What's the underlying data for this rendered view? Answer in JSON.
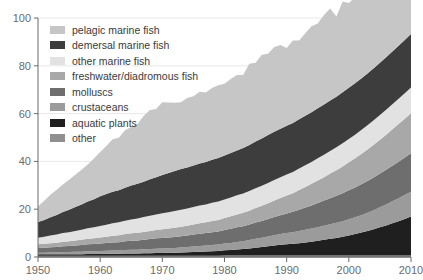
{
  "chart_data": {
    "type": "area",
    "title": "",
    "subtitle": "",
    "xlabel": "",
    "ylabel": "",
    "xlim": [
      1950,
      2010
    ],
    "ylim": [
      0,
      100
    ],
    "grid": true,
    "legend_position": "top-left",
    "stacked": true,
    "x_ticks": [
      "1950",
      "1960",
      "1970",
      "1980",
      "1990",
      "2000",
      "2010"
    ],
    "y_ticks": [
      "0",
      "20",
      "40",
      "60",
      "80",
      "100"
    ],
    "x": [
      1950,
      1951,
      1952,
      1953,
      1954,
      1955,
      1956,
      1957,
      1958,
      1959,
      1960,
      1961,
      1962,
      1963,
      1964,
      1965,
      1966,
      1967,
      1968,
      1969,
      1970,
      1971,
      1972,
      1973,
      1974,
      1975,
      1976,
      1977,
      1978,
      1979,
      1980,
      1981,
      1982,
      1983,
      1984,
      1985,
      1986,
      1987,
      1988,
      1989,
      1990,
      1991,
      1992,
      1993,
      1994,
      1995,
      1996,
      1997,
      1998,
      1999,
      2000,
      2001,
      2002,
      2003,
      2004,
      2005,
      2006,
      2007,
      2008,
      2009,
      2010
    ],
    "series": [
      {
        "name": "other",
        "color": "#8f8f8f",
        "values": [
          0.5,
          0.5,
          0.5,
          0.5,
          0.5,
          0.5,
          0.5,
          0.5,
          0.5,
          0.5,
          0.5,
          0.5,
          0.5,
          0.5,
          0.5,
          0.5,
          0.5,
          0.5,
          0.5,
          0.5,
          0.5,
          0.5,
          0.5,
          0.5,
          0.5,
          0.5,
          0.5,
          0.5,
          0.5,
          0.5,
          0.6,
          0.6,
          0.6,
          0.6,
          0.6,
          0.6,
          0.6,
          0.6,
          0.6,
          0.6,
          0.6,
          0.6,
          0.6,
          0.6,
          0.6,
          0.6,
          0.6,
          0.6,
          0.6,
          0.6,
          0.6,
          0.6,
          0.6,
          0.6,
          0.6,
          0.6,
          0.6,
          0.6,
          0.6,
          0.6,
          0.6
        ]
      },
      {
        "name": "aquatic plants",
        "color": "#1f1f1f",
        "values": [
          0.6,
          0.6,
          0.6,
          0.6,
          0.7,
          0.7,
          0.7,
          0.7,
          0.8,
          0.8,
          0.8,
          0.9,
          0.9,
          0.9,
          1.0,
          1.0,
          1.0,
          1.1,
          1.1,
          1.2,
          1.2,
          1.3,
          1.3,
          1.4,
          1.5,
          1.6,
          1.7,
          1.8,
          1.9,
          2.0,
          2.2,
          2.3,
          2.5,
          2.7,
          3.0,
          3.3,
          3.6,
          3.9,
          4.2,
          4.5,
          4.7,
          4.9,
          5.2,
          5.5,
          5.8,
          6.2,
          6.6,
          7.0,
          7.4,
          7.9,
          8.4,
          9.0,
          9.6,
          10.3,
          11.0,
          11.8,
          12.6,
          13.5,
          14.4,
          15.3,
          16.3
        ]
      },
      {
        "name": "crustaceans",
        "color": "#9b9b9b",
        "values": [
          0.7,
          0.7,
          0.8,
          0.8,
          0.9,
          0.9,
          1.0,
          1.0,
          1.1,
          1.1,
          1.2,
          1.2,
          1.3,
          1.3,
          1.4,
          1.5,
          1.5,
          1.6,
          1.7,
          1.8,
          1.9,
          1.9,
          2.0,
          2.1,
          2.2,
          2.3,
          2.4,
          2.5,
          2.6,
          2.7,
          2.8,
          3.0,
          3.2,
          3.3,
          3.5,
          3.7,
          3.9,
          4.1,
          4.3,
          4.5,
          4.7,
          4.9,
          5.1,
          5.3,
          5.5,
          5.7,
          5.9,
          6.1,
          6.3,
          6.5,
          6.8,
          7.0,
          7.3,
          7.6,
          8.0,
          8.4,
          8.8,
          9.2,
          9.6,
          10.0,
          10.4
        ]
      },
      {
        "name": "molluscs",
        "color": "#6e6e6e",
        "values": [
          2.0,
          2.1,
          2.2,
          2.3,
          2.4,
          2.5,
          2.6,
          2.8,
          2.9,
          3.0,
          3.2,
          3.3,
          3.4,
          3.5,
          3.7,
          3.8,
          3.9,
          4.0,
          4.2,
          4.3,
          4.4,
          4.5,
          4.6,
          4.7,
          4.8,
          5.0,
          5.1,
          5.2,
          5.4,
          5.5,
          5.7,
          5.9,
          6.1,
          6.3,
          6.5,
          6.8,
          7.0,
          7.3,
          7.6,
          7.9,
          8.2,
          8.5,
          8.9,
          9.3,
          9.7,
          10.1,
          10.5,
          10.9,
          11.3,
          11.7,
          12.1,
          12.5,
          12.9,
          13.3,
          13.7,
          14.1,
          14.5,
          14.9,
          15.3,
          15.7,
          16.1
        ]
      },
      {
        "name": "freshwater/diadromous fish",
        "color": "#a8a8a8",
        "values": [
          1.5,
          1.6,
          1.7,
          1.8,
          1.9,
          2.0,
          2.1,
          2.2,
          2.3,
          2.4,
          2.5,
          2.6,
          2.8,
          2.9,
          3.0,
          3.1,
          3.2,
          3.3,
          3.4,
          3.5,
          3.6,
          3.7,
          3.8,
          4.0,
          4.1,
          4.2,
          4.4,
          4.5,
          4.7,
          4.8,
          5.0,
          5.2,
          5.4,
          5.6,
          5.8,
          6.1,
          6.3,
          6.6,
          6.9,
          7.2,
          7.5,
          7.8,
          8.2,
          8.6,
          9.0,
          9.4,
          9.8,
          10.3,
          10.7,
          11.2,
          11.7,
          12.2,
          12.7,
          13.2,
          13.7,
          14.2,
          14.7,
          15.2,
          15.7,
          16.2,
          16.7
        ]
      },
      {
        "name": "other marine fish",
        "color": "#e2e2e2",
        "values": [
          2.8,
          3.0,
          3.2,
          3.4,
          3.6,
          3.8,
          4.0,
          4.2,
          4.4,
          4.6,
          4.8,
          5.0,
          5.2,
          5.4,
          5.6,
          5.8,
          6.0,
          6.2,
          6.4,
          6.5,
          6.7,
          6.8,
          7.0,
          7.1,
          7.2,
          7.3,
          7.4,
          7.5,
          7.6,
          7.7,
          7.8,
          7.9,
          8.0,
          8.1,
          8.2,
          8.3,
          8.4,
          8.5,
          8.6,
          8.7,
          8.8,
          8.9,
          9.0,
          9.1,
          9.2,
          9.3,
          9.4,
          9.5,
          9.6,
          9.7,
          9.8,
          9.9,
          10.0,
          10.1,
          10.2,
          10.3,
          10.4,
          10.5,
          10.6,
          10.7,
          10.8
        ]
      },
      {
        "name": "demersal marine fish",
        "color": "#3d3d3d",
        "values": [
          6.5,
          7.0,
          7.6,
          8.2,
          8.8,
          9.4,
          10.0,
          10.6,
          11.2,
          11.8,
          12.4,
          12.9,
          13.2,
          13.4,
          13.8,
          14.2,
          14.5,
          14.8,
          15.2,
          15.6,
          16.0,
          16.4,
          16.8,
          17.0,
          17.2,
          17.4,
          17.6,
          17.8,
          18.0,
          18.2,
          18.4,
          18.6,
          18.8,
          19.0,
          19.3,
          19.5,
          19.8,
          20.0,
          20.2,
          20.3,
          20.4,
          20.5,
          20.6,
          20.7,
          20.8,
          20.9,
          21.0,
          21.1,
          21.2,
          21.3,
          21.4,
          21.5,
          21.6,
          21.7,
          21.8,
          21.9,
          22.0,
          22.1,
          22.2,
          22.3,
          22.4
        ]
      },
      {
        "name": "pelagic marine fish",
        "color": "#c6c6c6",
        "values": [
          6.5,
          8.0,
          9.4,
          10.5,
          11.5,
          12.5,
          13.5,
          14.5,
          15.5,
          17.0,
          18.5,
          20.0,
          22.0,
          22.0,
          24.0,
          24.5,
          25.0,
          27.5,
          29.0,
          28.5,
          30.5,
          29.5,
          28.5,
          28.0,
          29.0,
          29.0,
          30.0,
          29.0,
          30.0,
          30.5,
          30.0,
          31.0,
          31.5,
          30.5,
          34.0,
          33.0,
          35.0,
          34.0,
          35.5,
          35.0,
          32.5,
          34.5,
          33.0,
          34.5,
          36.0,
          35.5,
          37.5,
          38.5,
          33.5,
          38.0,
          35.5,
          36.0,
          34.5,
          34.5,
          35.0,
          35.0,
          33.5,
          33.0,
          33.5,
          33.0,
          33.0
        ]
      }
    ],
    "legend": [
      {
        "label": "pelagic marine fish",
        "color": "#c6c6c6"
      },
      {
        "label": "demersal marine fish",
        "color": "#3d3d3d"
      },
      {
        "label": "other marine fish",
        "color": "#e2e2e2"
      },
      {
        "label": "freshwater/diadromous fish",
        "color": "#a8a8a8"
      },
      {
        "label": "molluscs",
        "color": "#6e6e6e"
      },
      {
        "label": "crustaceans",
        "color": "#9b9b9b"
      },
      {
        "label": "aquatic plants",
        "color": "#1f1f1f"
      },
      {
        "label": "other",
        "color": "#8f8f8f"
      }
    ]
  },
  "axis_color": "#6b6b6b",
  "grid_color": "#e8e8e8",
  "background": "#ffffff"
}
